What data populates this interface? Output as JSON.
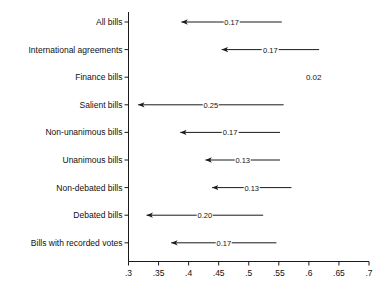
{
  "chart_data": {
    "type": "bar",
    "title": "",
    "subtitle": "",
    "xlabel": "",
    "ylabel": "",
    "xlim": [
      0.3,
      0.7
    ],
    "grid": false,
    "legend": null,
    "orientation": "horizontal",
    "style": "arrow-range-plot",
    "xticks": [
      0.3,
      0.35,
      0.4,
      0.45,
      0.5,
      0.55,
      0.6,
      0.65,
      0.7
    ],
    "xtick_labels": [
      ".3",
      ".35",
      ".4",
      ".45",
      ".5",
      ".55",
      ".6",
      ".65",
      ".7"
    ],
    "categories": [
      "All bills",
      "International agreements",
      "Finance bills",
      "Salient bills",
      "Non-unanimous bills",
      "Unanimous bills",
      "Non-debated bills",
      "Debated bills",
      "Bills with recorded votes"
    ],
    "series": [
      {
        "name": "change",
        "points": [
          {
            "category": "All bills",
            "start": 0.555,
            "end": 0.388,
            "delta": -0.17,
            "label": "0.17",
            "arrow": true
          },
          {
            "category": "International agreements",
            "start": 0.617,
            "end": 0.455,
            "delta": -0.17,
            "label": "0.17",
            "arrow": true
          },
          {
            "category": "Finance bills",
            "start": null,
            "end": null,
            "delta": -0.02,
            "label": "0.02",
            "arrow": false
          },
          {
            "category": "Salient bills",
            "start": 0.558,
            "end": 0.316,
            "delta": -0.25,
            "label": "0.25",
            "arrow": true
          },
          {
            "category": "Non-unanimous bills",
            "start": 0.552,
            "end": 0.386,
            "delta": -0.17,
            "label": "0.17",
            "arrow": true
          },
          {
            "category": "Unanimous bills",
            "start": 0.552,
            "end": 0.428,
            "delta": -0.13,
            "label": "0.13",
            "arrow": true
          },
          {
            "category": "Non-debated bills",
            "start": 0.571,
            "end": 0.439,
            "delta": -0.13,
            "label": "0.13",
            "arrow": true
          },
          {
            "category": "Debated bills",
            "start": 0.524,
            "end": 0.33,
            "delta": -0.2,
            "label": "0.20",
            "arrow": true
          },
          {
            "category": "Bills with recorded votes",
            "start": 0.546,
            "end": 0.371,
            "delta": -0.17,
            "label": "0.17",
            "arrow": true
          }
        ]
      }
    ],
    "no_arrow_label_position": 0.77,
    "colors": {
      "line": "#1a1a1a",
      "axis": "#1a1a1a",
      "text": "#111111",
      "background": "#ffffff"
    }
  }
}
